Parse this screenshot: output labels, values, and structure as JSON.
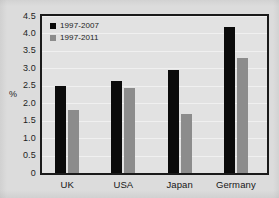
{
  "chart_data": {
    "type": "bar",
    "title": "",
    "subtitle": "",
    "xlabel": "",
    "ylabel": "%",
    "ylim": [
      0,
      4.5
    ],
    "yticks": [
      "0",
      "0.5",
      "1.0",
      "1.5",
      "2.0",
      "2.5",
      "3.0",
      "3.5",
      "4.0",
      "4.5"
    ],
    "ytick_values": [
      0,
      0.5,
      1.0,
      1.5,
      2.0,
      2.5,
      3.0,
      3.5,
      4.0,
      4.5
    ],
    "grid": true,
    "grid_axis": "y",
    "legend_position": "top-left-inside",
    "categories": [
      "UK",
      "USA",
      "Japan",
      "Germany"
    ],
    "series": [
      {
        "name": "1997-2007",
        "color": "#0b0b0b",
        "values": [
          2.5,
          2.65,
          2.95,
          4.18
        ]
      },
      {
        "name": "1997-2011",
        "color": "#8c8c8c",
        "values": [
          1.82,
          2.45,
          1.68,
          3.3
        ]
      }
    ]
  },
  "figure": {
    "background_color": "#dcdcdc",
    "plot_background_color": "#e2e2e2",
    "axis_color": "#1a1a1a",
    "gridline_color": "#f2f2f2"
  }
}
